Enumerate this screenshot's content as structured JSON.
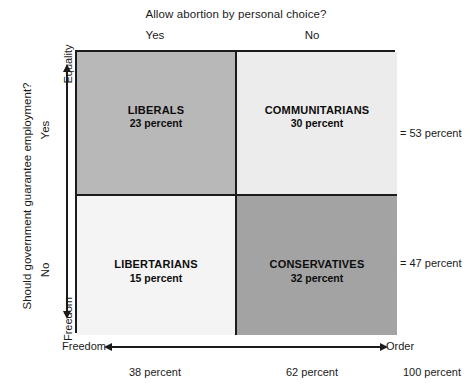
{
  "chart_data": {
    "type": "table",
    "title": "Allow abortion by personal choice?",
    "xlabel": "Freedom – Order",
    "ylabel": "Should government guarantee employment?",
    "categories": [
      "Yes",
      "No"
    ],
    "row_categories": [
      "Yes",
      "No"
    ],
    "cells": [
      {
        "name": "LIBERALS",
        "value": 23,
        "value_label": "23 percent",
        "row": "Yes",
        "column": "Yes",
        "shade": "#b8b8b8"
      },
      {
        "name": "COMMUNITARIANS",
        "value": 30,
        "value_label": "30 percent",
        "row": "Yes",
        "column": "No",
        "shade": "#ececec"
      },
      {
        "name": "LIBERTARIANS",
        "value": 15,
        "value_label": "15 percent",
        "row": "No",
        "column": "Yes",
        "shade": "#f4f4f4"
      },
      {
        "name": "CONSERVATIVES",
        "value": 32,
        "value_label": "32 percent",
        "row": "No",
        "column": "No",
        "shade": "#a3a3a3"
      }
    ],
    "row_totals": [
      53,
      47
    ],
    "column_totals": [
      38,
      62
    ],
    "grand_total": 100
  },
  "top": {
    "title": "Allow abortion by personal choice?",
    "col_yes": "Yes",
    "col_no": "No"
  },
  "left": {
    "question": "Should government guarantee employment?",
    "row_yes": "Yes",
    "row_no": "No",
    "axis_top": "Equality",
    "axis_bottom": "Freedom"
  },
  "quadrants": {
    "liberals": {
      "name": "LIBERALS",
      "percent": "23 percent"
    },
    "communitarians": {
      "name": "COMMUNITARIANS",
      "percent": "30 percent"
    },
    "libertarians": {
      "name": "LIBERTARIANS",
      "percent": "15 percent"
    },
    "conservatives": {
      "name": "CONSERVATIVES",
      "percent": "32 percent"
    }
  },
  "row_totals": {
    "top": "= 53 percent",
    "bottom": "= 47 percent"
  },
  "bottom": {
    "axis_left": "Freedom",
    "axis_right": "Order",
    "total_left": "38 percent",
    "total_right": "62 percent",
    "total_all": "100 percent"
  },
  "colors": {
    "liberals": "#b8b8b8",
    "communitarians": "#ececec",
    "libertarians": "#f4f4f4",
    "conservatives": "#a3a3a3",
    "rule": "#1b1b1b",
    "text": "#111111"
  }
}
